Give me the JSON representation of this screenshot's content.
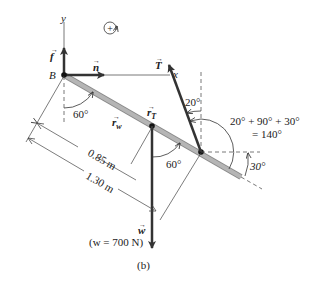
{
  "figure": {
    "caption": "(b)",
    "rotation_symbol": "+",
    "axes": {
      "x_label": "x",
      "y_label": "y",
      "origin_label": "B"
    },
    "vectors": {
      "f": {
        "label": "f",
        "arrow": "→"
      },
      "n": {
        "label": "n",
        "arrow": "→"
      },
      "T": {
        "label": "T",
        "arrow": "→"
      },
      "w": {
        "label": "w",
        "arrow": "→"
      },
      "r_w": {
        "label": "r",
        "sub": "w",
        "arrow": "→"
      },
      "r_T": {
        "label": "r",
        "sub": "T",
        "arrow": "→"
      }
    },
    "weight_note": "(w = 700 N)",
    "angles": {
      "at_B": "60°",
      "at_cm": "60°",
      "cable_from_vertical": "20°",
      "rod_below_horizontal": "30°",
      "sum_line1": "20° + 90° + 30°",
      "sum_line2": "= 140°"
    },
    "dimensions": {
      "short": "0.85 m",
      "long": "1.30 m"
    },
    "colors": {
      "rod": "#b0b0b0",
      "rod_edge": "#8a8a8a",
      "arrow": "#333333",
      "line": "#444444"
    }
  }
}
